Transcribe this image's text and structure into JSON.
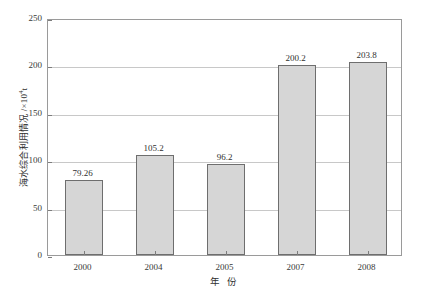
{
  "chart_data": {
    "type": "bar",
    "title": "",
    "categories": [
      "2000",
      "2004",
      "2005",
      "2007",
      "2008"
    ],
    "values": [
      79.26,
      105.2,
      96.2,
      200.2,
      203.8
    ],
    "value_labels": [
      "79.26",
      "105.2",
      "96.2",
      "200.2",
      "203.8"
    ],
    "xlabel": "年 份",
    "ylabel_text": "海水综合利用情况 /×10",
    "ylabel_exponent": "4",
    "ylabel_unit": "t",
    "ylabel_full": "海水综合利用情况 /×10⁴t",
    "ylim": [
      0,
      250
    ],
    "yticks": [
      0,
      50,
      100,
      150,
      200,
      250
    ],
    "ytick_labels": [
      "0",
      "50",
      "100",
      "150",
      "200",
      "250"
    ],
    "grid": true,
    "grid_axis": "y",
    "legend": null,
    "legend_position": "none",
    "bar_fill_color": "#d6d6d6",
    "bar_border_color": "#6e6e6e",
    "frame_color": "#9a9a9a",
    "grid_color": "#c8c8c8",
    "background_color": "#ffffff",
    "text_color": "#2f2f2f"
  }
}
